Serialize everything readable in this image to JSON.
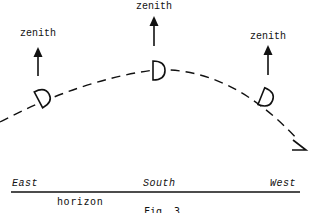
{
  "figure": {
    "caption": "Fig. 3",
    "stroke_color": "#111111",
    "background": "#ffffff"
  },
  "zenith_labels": [
    {
      "position": "east",
      "text": "zenith"
    },
    {
      "position": "south",
      "text": "zenith"
    },
    {
      "position": "west",
      "text": "zenith"
    }
  ],
  "horizon": {
    "label": "horizon",
    "directions": [
      {
        "name": "east",
        "text": "East"
      },
      {
        "name": "south",
        "text": "South"
      },
      {
        "name": "west",
        "text": "West"
      }
    ]
  },
  "path": {
    "style": "dashed",
    "description": "sun's apparent path across the sky from east to west",
    "markers": [
      "east-sun-symbol",
      "south-sun-symbol",
      "west-sun-symbol"
    ]
  }
}
